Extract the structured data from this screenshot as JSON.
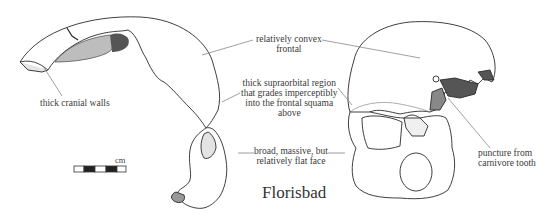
{
  "figure": {
    "title": "Florisbad",
    "scale_bar": {
      "unit_label": "cm",
      "segments": [
        "white",
        "black",
        "white",
        "black",
        "white"
      ]
    },
    "annotations": [
      {
        "id": "cranial-walls",
        "lines": [
          "thick cranial walls"
        ]
      },
      {
        "id": "convex-frontal",
        "lines": [
          "relatively convex",
          "frontal"
        ]
      },
      {
        "id": "supraorbital",
        "lines": [
          "thick supraorbital region",
          "that grades imperceptibly",
          "into the frontal squama",
          "above"
        ]
      },
      {
        "id": "flat-face",
        "lines": [
          "broad, massive, but",
          "relatively flat face"
        ]
      },
      {
        "id": "puncture",
        "lines": [
          "puncture from",
          "carnivore tooth"
        ]
      }
    ],
    "views": [
      "lateral view",
      "frontal view"
    ],
    "colors": {
      "ink": "#2a2a2a",
      "label": "#3a3a3a",
      "leader": "#777777",
      "background": "#ffffff"
    }
  }
}
